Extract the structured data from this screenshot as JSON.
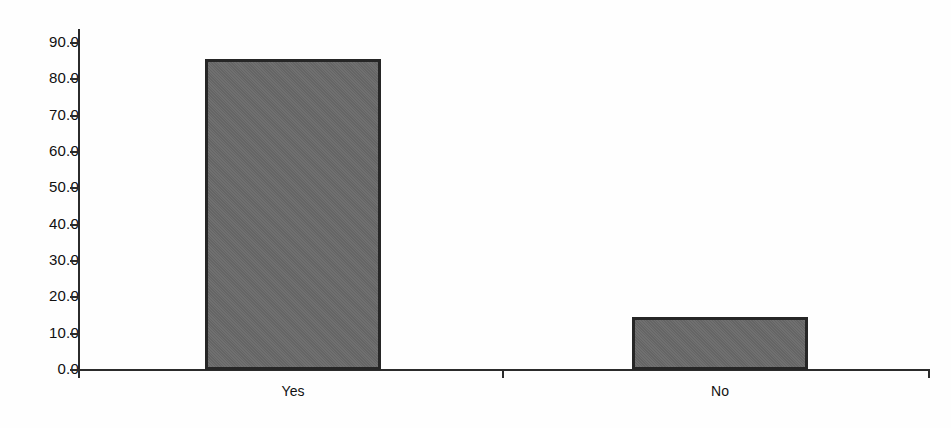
{
  "chart_data": {
    "type": "bar",
    "title": "",
    "subtitle": "",
    "xlabel": "",
    "ylabel": "",
    "categories": [
      "Yes",
      "No"
    ],
    "values": [
      85.5,
      14.5
    ],
    "ylim": [
      0.0,
      90.0
    ],
    "y_ticks": [
      "0.0",
      "10.0",
      "20.0",
      "30.0",
      "40.0",
      "50.0",
      "60.0",
      "70.0",
      "80.0",
      "90.0"
    ],
    "y_tick_values": [
      0.0,
      10.0,
      20.0,
      30.0,
      40.0,
      50.0,
      60.0,
      70.0,
      80.0,
      90.0
    ],
    "grid": false,
    "legend": null,
    "legend_position": "none",
    "bar_fill_color": "#6a6a6a",
    "bar_border_color": "#262626",
    "axis_color": "#2b2b2b",
    "background_color": "#fefefe"
  }
}
